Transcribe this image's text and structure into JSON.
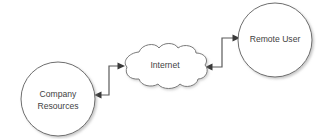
{
  "diagram": {
    "background_color": "#ffffff",
    "stroke_color": "#6e6e6e",
    "text_color": "#3f3f3f",
    "arrow_color": "#3a3a3a",
    "nodes": [
      {
        "id": "company-resources",
        "shape": "circle",
        "label_line_1": "Company",
        "label_line_2": "Resources",
        "cx": 58,
        "cy": 99,
        "r": 37
      },
      {
        "id": "internet",
        "shape": "cloud",
        "label": "Internet",
        "cx": 165,
        "cy": 66
      },
      {
        "id": "remote-user",
        "shape": "circle",
        "label_line_1": "Remote User",
        "label_line_2": "",
        "cx": 275,
        "cy": 40,
        "r": 37
      }
    ],
    "connectors": [
      {
        "id": "company-to-internet",
        "from": "company-resources",
        "to": "internet",
        "style": "elbow",
        "arrowheads": "both"
      },
      {
        "id": "internet-to-remote-user",
        "from": "internet",
        "to": "remote-user",
        "style": "elbow",
        "arrowheads": "both"
      }
    ]
  }
}
